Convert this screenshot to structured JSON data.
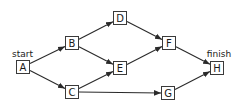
{
  "diagram": {
    "type": "directed-graph",
    "colors": {
      "line": "#2a2a2a",
      "node_border": "#3a3a3a",
      "text": "#1a1a1a",
      "background": "#ffffff"
    },
    "labels": {
      "start": "start",
      "finish": "finish"
    },
    "nodes": [
      {
        "id": "A",
        "label": "A",
        "x": 16,
        "y": 60
      },
      {
        "id": "B",
        "label": "B",
        "x": 65,
        "y": 36
      },
      {
        "id": "C",
        "label": "C",
        "x": 65,
        "y": 85
      },
      {
        "id": "D",
        "label": "D",
        "x": 113,
        "y": 11
      },
      {
        "id": "E",
        "label": "E",
        "x": 113,
        "y": 61
      },
      {
        "id": "F",
        "label": "F",
        "x": 162,
        "y": 36
      },
      {
        "id": "G",
        "label": "G",
        "x": 161,
        "y": 86
      },
      {
        "id": "H",
        "label": "H",
        "x": 210,
        "y": 61
      }
    ],
    "edges": [
      {
        "from": "A",
        "to": "B"
      },
      {
        "from": "A",
        "to": "C"
      },
      {
        "from": "B",
        "to": "D"
      },
      {
        "from": "B",
        "to": "E"
      },
      {
        "from": "C",
        "to": "E"
      },
      {
        "from": "C",
        "to": "G"
      },
      {
        "from": "D",
        "to": "F"
      },
      {
        "from": "E",
        "to": "F"
      },
      {
        "from": "F",
        "to": "H"
      },
      {
        "from": "G",
        "to": "H"
      }
    ]
  }
}
